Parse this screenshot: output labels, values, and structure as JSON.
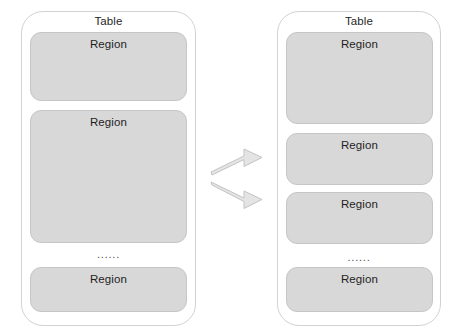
{
  "diagram": {
    "type": "table-region-split",
    "background_color": "#ffffff",
    "region_fill_color": "#d8d8d8",
    "region_border_color": "#c6c6c6",
    "table_border_color": "#d2d2d2",
    "arrow_fill_color": "#e2e2e2",
    "arrow_border_color": "#bdbdbd",
    "ellipsis_text": "......"
  },
  "left_table": {
    "title": "Table",
    "regions": [
      {
        "label": "Region"
      },
      {
        "label": "Region"
      },
      {
        "label": "Region"
      }
    ],
    "ellipsis": "......"
  },
  "right_table": {
    "title": "Table",
    "regions": [
      {
        "label": "Region"
      },
      {
        "label": "Region"
      },
      {
        "label": "Region"
      },
      {
        "label": "Region"
      }
    ],
    "ellipsis": "......"
  },
  "arrows": {
    "count": 2,
    "direction": "right",
    "upper_label": "",
    "lower_label": ""
  }
}
